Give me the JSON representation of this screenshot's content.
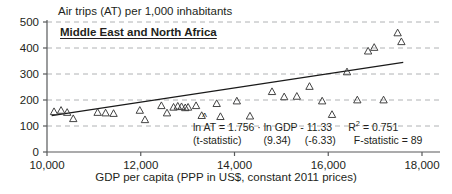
{
  "chart_data": {
    "type": "scatter",
    "title": "Air trips (AT) per 1,000 inhabitants",
    "region": "Middle East and North Africa",
    "xlabel": "GDP per capita (PPP in US$, constant 2011 prices)",
    "ylabel": "",
    "xlim": [
      10000,
      18000
    ],
    "ylim": [
      0,
      500
    ],
    "xticks": [
      "10,000",
      "12,000",
      "14,000",
      "16,000",
      "18,000"
    ],
    "xtick_values": [
      10000,
      12000,
      14000,
      16000,
      18000
    ],
    "yticks": [
      "0",
      "100",
      "200",
      "300",
      "400",
      "500"
    ],
    "ytick_values": [
      0,
      100,
      200,
      300,
      400,
      500
    ],
    "grid": "horizontal-dashed",
    "legend": "none",
    "marker": "open-triangle",
    "points": [
      {
        "x": 10150,
        "y": 155
      },
      {
        "x": 10300,
        "y": 160
      },
      {
        "x": 10430,
        "y": 152
      },
      {
        "x": 10560,
        "y": 128
      },
      {
        "x": 11080,
        "y": 152
      },
      {
        "x": 11250,
        "y": 150
      },
      {
        "x": 11420,
        "y": 148
      },
      {
        "x": 11980,
        "y": 160
      },
      {
        "x": 12090,
        "y": 124
      },
      {
        "x": 12440,
        "y": 178
      },
      {
        "x": 12560,
        "y": 150
      },
      {
        "x": 12700,
        "y": 172
      },
      {
        "x": 12790,
        "y": 176
      },
      {
        "x": 12870,
        "y": 174
      },
      {
        "x": 12950,
        "y": 170
      },
      {
        "x": 13010,
        "y": 172
      },
      {
        "x": 13180,
        "y": 178
      },
      {
        "x": 13300,
        "y": 140
      },
      {
        "x": 13620,
        "y": 186
      },
      {
        "x": 13700,
        "y": 136
      },
      {
        "x": 14050,
        "y": 196
      },
      {
        "x": 14330,
        "y": 138
      },
      {
        "x": 14800,
        "y": 232
      },
      {
        "x": 15060,
        "y": 212
      },
      {
        "x": 15330,
        "y": 214
      },
      {
        "x": 15600,
        "y": 252
      },
      {
        "x": 15870,
        "y": 196
      },
      {
        "x": 16080,
        "y": 144
      },
      {
        "x": 16400,
        "y": 308
      },
      {
        "x": 16620,
        "y": 200
      },
      {
        "x": 16850,
        "y": 388
      },
      {
        "x": 16980,
        "y": 402
      },
      {
        "x": 17180,
        "y": 200
      },
      {
        "x": 17480,
        "y": 458
      },
      {
        "x": 17560,
        "y": 424
      }
    ],
    "trendline": {
      "x_start": 10100,
      "y_start": 140,
      "x_end": 17600,
      "y_end": 345
    },
    "equation": {
      "lhs": "ln AT",
      "body": " = 1.756 · ln GDP - 11.33",
      "r_squared_label": "R",
      "r_squared_sup": "2",
      "r_squared_value": " = 0.751",
      "stat_label": "(t-statistic)",
      "t_slope": "(9.34)",
      "t_intercept": "(-6.33)",
      "f_statistic": "F-statistic = 89"
    }
  },
  "colors": {
    "axis": "#58595b",
    "grid": "#a7a9ac",
    "text": "#231f20",
    "marker_stroke": "#3a3a3a",
    "trend": "#1a1a1a"
  }
}
